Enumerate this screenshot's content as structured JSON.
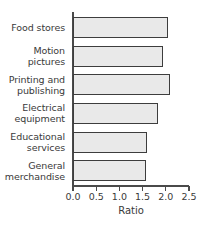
{
  "chart_data": {
    "type": "bar",
    "orientation": "horizontal",
    "title": "",
    "xlabel": "Ratio",
    "ylabel": "",
    "categories": [
      "Food stores",
      "Motion pictures",
      "Printing and publishing",
      "Electrical equipment",
      "Educational services",
      "General merchandise"
    ],
    "values": [
      2.05,
      1.93,
      2.09,
      1.83,
      1.6,
      1.57
    ],
    "xlim": [
      0.0,
      2.5
    ],
    "xticks": [
      0.0,
      0.5,
      1.0,
      1.5,
      2.0,
      2.5
    ],
    "xticklabels": [
      "0.0",
      "0.5",
      "1.0",
      "1.5",
      "2.0",
      "2.5"
    ],
    "grid": false,
    "legend": null,
    "bar_fill_color": "#e9e9e9",
    "bar_edge_color": "#3d3d3d",
    "axis_color": "#4a4a4a",
    "text_color": "#3a3a3a",
    "background_color": "#ffffff"
  }
}
